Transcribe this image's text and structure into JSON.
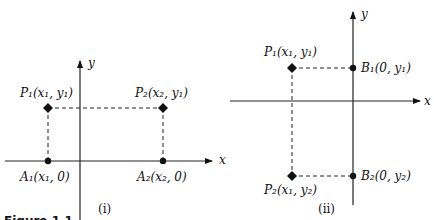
{
  "figure_caption": "Figure 1.1",
  "panels": [
    {
      "id": "i",
      "caption": "(i)",
      "x_axis_label": "x",
      "y_axis_label": "y",
      "points": [
        {
          "name": "P1",
          "label": "P₁(x₁, y₁)"
        },
        {
          "name": "P2",
          "label": "P₂(x₂, y₁)"
        },
        {
          "name": "A1",
          "label": "A₁(x₁, 0)"
        },
        {
          "name": "A2",
          "label": "A₂(x₂, 0)"
        }
      ]
    },
    {
      "id": "ii",
      "caption": "(ii)",
      "x_axis_label": "x",
      "y_axis_label": "y",
      "points": [
        {
          "name": "P1",
          "label": "P₁(x₁, y₁)"
        },
        {
          "name": "B1",
          "label": "B₁(0, y₁)"
        },
        {
          "name": "P2",
          "label": "P₂(x₁, y₂)"
        },
        {
          "name": "B2",
          "label": "B₂(0, y₂)"
        }
      ]
    }
  ]
}
